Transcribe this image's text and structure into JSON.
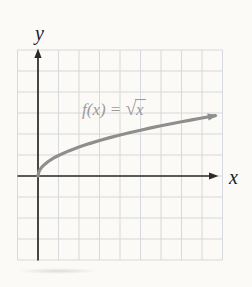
{
  "figure": {
    "background": "#fbfaf7"
  },
  "colors": {
    "grid": "#d6d9dd",
    "axis": "#2a2a2a",
    "curve": "#8e8e8e",
    "curve_label": "#9a9a9a",
    "axis_label": "#1d1d1d"
  },
  "chart_data": {
    "type": "line",
    "title": "",
    "xlabel": "x",
    "ylabel": "y",
    "x_range": [
      -1,
      9
    ],
    "y_range": [
      -4,
      6
    ],
    "grid": true,
    "legend": "none",
    "curve_label": "f(x) = √x",
    "curve_label_parts": {
      "prefix": "f(x) = ",
      "radical": "√",
      "radicand": "x"
    },
    "series": [
      {
        "name": "f(x) = √x",
        "points": [
          [
            0,
            0
          ],
          [
            0.05,
            0.224
          ],
          [
            0.1,
            0.316
          ],
          [
            0.2,
            0.447
          ],
          [
            0.35,
            0.592
          ],
          [
            0.5,
            0.707
          ],
          [
            0.75,
            0.866
          ],
          [
            1,
            1
          ],
          [
            1.5,
            1.225
          ],
          [
            2,
            1.414
          ],
          [
            2.5,
            1.581
          ],
          [
            3,
            1.732
          ],
          [
            3.5,
            1.871
          ],
          [
            4,
            2
          ],
          [
            4.5,
            2.121
          ],
          [
            5,
            2.236
          ],
          [
            5.5,
            2.345
          ],
          [
            6,
            2.449
          ],
          [
            6.5,
            2.55
          ],
          [
            7,
            2.646
          ],
          [
            7.5,
            2.739
          ],
          [
            8,
            2.828
          ],
          [
            8.65,
            2.941
          ]
        ]
      }
    ]
  }
}
